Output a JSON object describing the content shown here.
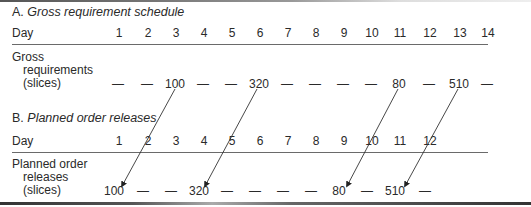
{
  "section_a": {
    "prefix": "A.",
    "title": "Gross requirement schedule",
    "day_label": "Day",
    "days": [
      "1",
      "2",
      "3",
      "4",
      "5",
      "6",
      "7",
      "8",
      "9",
      "10",
      "11",
      "12",
      "13",
      "14"
    ],
    "row_label": [
      "Gross",
      "requirements",
      "(slices)"
    ],
    "values": [
      "—",
      "—",
      "100",
      "—",
      "—",
      "320",
      "—",
      "—",
      "—",
      "—",
      "80",
      "—",
      "510",
      "—"
    ]
  },
  "section_b": {
    "prefix": "B.",
    "title": "Planned order releases",
    "day_label": "Day",
    "days": [
      "1",
      "2",
      "3",
      "4",
      "5",
      "6",
      "7",
      "8",
      "9",
      "10",
      "11",
      "12"
    ],
    "row_label": [
      "Planned order",
      "releases",
      "(slices)"
    ],
    "values": [
      "100",
      "—",
      "—",
      "320",
      "—",
      "—",
      "—",
      "—",
      "80",
      "—",
      "510",
      "—"
    ]
  },
  "arrows": [
    {
      "from": "A day 3 (100)",
      "to": "B day 1 (100)"
    },
    {
      "from": "A day 6 (320)",
      "to": "B day 4 (320)"
    },
    {
      "from": "A day 11 (80)",
      "to": "B day 9 (80)"
    },
    {
      "from": "A day 13 (510)",
      "to": "B day 11 (510)"
    }
  ]
}
